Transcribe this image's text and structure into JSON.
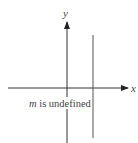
{
  "diagram": {
    "axes": {
      "x_label": "x",
      "y_label": "y"
    },
    "caption": {
      "variable": "m",
      "text": " is undefined"
    },
    "colors": {
      "axis": "#333333",
      "line": "#555555",
      "text": "#555555"
    }
  }
}
